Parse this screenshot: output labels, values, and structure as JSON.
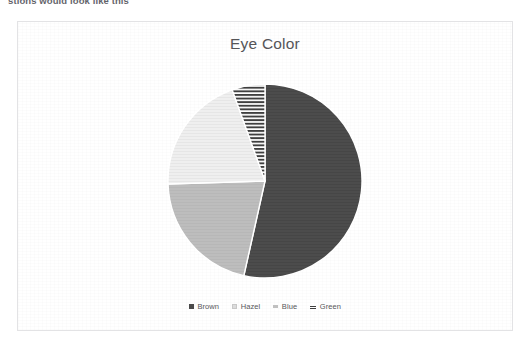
{
  "page": {
    "clipped_top_text": "stions would look like this"
  },
  "chart_card": {
    "border_color": "#e3e3e5",
    "background": "#ffffff"
  },
  "chart_data": {
    "type": "pie",
    "title": "Eye Color",
    "xlabel": "",
    "ylabel": "",
    "legend_position": "bottom",
    "grid": false,
    "categories": [
      "Brown",
      "Hazel",
      "Blue",
      "Green"
    ],
    "values": [
      53.5,
      20.0,
      21.0,
      5.5
    ],
    "slices": [
      {
        "label": "Brown",
        "value": 53.5,
        "color": "#4a4a4a",
        "pattern": "solid",
        "start_angle_deg": 0,
        "end_angle_deg": 192.6
      },
      {
        "label": "Blue",
        "value": 21.0,
        "color": "#bcbcbc",
        "pattern": "solid",
        "start_angle_deg": 192.6,
        "end_angle_deg": 268.2
      },
      {
        "label": "Hazel",
        "value": 20.0,
        "color": "#ededed",
        "pattern": "fine-texture",
        "start_angle_deg": 268.2,
        "end_angle_deg": 340.2
      },
      {
        "label": "Green",
        "value": 5.5,
        "color": "#3f3f3f",
        "pattern": "horizontal-stripes",
        "start_angle_deg": 340.2,
        "end_angle_deg": 360
      }
    ],
    "legend": [
      {
        "label": "Brown",
        "marker": "square-solid-dark",
        "color": "#4a4a4a"
      },
      {
        "label": "Hazel",
        "marker": "square-light",
        "color": "#dcdcdc"
      },
      {
        "label": "Blue",
        "marker": "dash-gray",
        "color": "#c0c0c0"
      },
      {
        "label": "Green",
        "marker": "dash-striped",
        "color": "#3f3f3f"
      }
    ]
  }
}
